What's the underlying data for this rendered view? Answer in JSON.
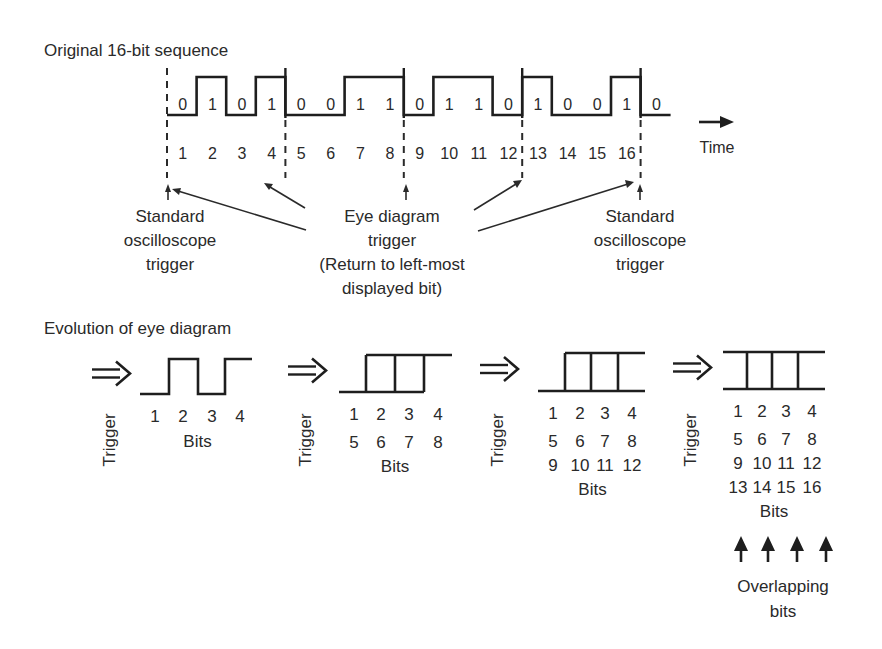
{
  "top": {
    "title": "Original 16-bit sequence",
    "bits": [
      "0",
      "1",
      "0",
      "1",
      "0",
      "0",
      "1",
      "1",
      "0",
      "1",
      "1",
      "0",
      "1",
      "0",
      "0",
      "1"
    ],
    "trailing_bit": "0",
    "bit_numbers": [
      "1",
      "2",
      "3",
      "4",
      "5",
      "6",
      "7",
      "8",
      "9",
      "10",
      "11",
      "12",
      "13",
      "14",
      "15",
      "16"
    ],
    "time_label": "Time",
    "left_label": [
      "Standard",
      "oscilloscope",
      "trigger"
    ],
    "center_label": [
      "Eye diagram",
      "trigger",
      "(Return to left-most",
      "displayed bit)"
    ],
    "right_label": [
      "Standard",
      "oscilloscope",
      "trigger"
    ]
  },
  "bottom": {
    "title": "Evolution of eye diagram",
    "trigger_label": "Trigger",
    "bits_label": "Bits",
    "stages": [
      {
        "rows": [
          [
            "1",
            "2",
            "3",
            "4"
          ]
        ]
      },
      {
        "rows": [
          [
            "1",
            "2",
            "3",
            "4"
          ],
          [
            "5",
            "6",
            "7",
            "8"
          ]
        ]
      },
      {
        "rows": [
          [
            "1",
            "2",
            "3",
            "4"
          ],
          [
            "5",
            "6",
            "7",
            "8"
          ],
          [
            "9",
            "10",
            "11",
            "12"
          ]
        ]
      },
      {
        "rows": [
          [
            "1",
            "2",
            "3",
            "4"
          ],
          [
            "5",
            "6",
            "7",
            "8"
          ],
          [
            "9",
            "10",
            "11",
            "12"
          ],
          [
            "13",
            "14",
            "15",
            "16"
          ]
        ]
      }
    ],
    "overlap_label": [
      "Overlapping",
      "bits"
    ]
  }
}
